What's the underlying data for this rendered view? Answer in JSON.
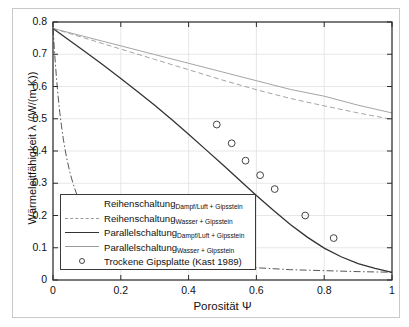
{
  "chart_data": {
    "type": "line",
    "title": "",
    "xlabel": "Porosität Ψ",
    "ylabel": "Wärmeleitfähigkeit λ /(W/(m K))",
    "xlim": [
      0,
      1
    ],
    "ylim": [
      0,
      0.8
    ],
    "xticks": [
      "0",
      "0.2",
      "0.4",
      "0.6",
      "0.8",
      "1"
    ],
    "xtick_values": [
      0,
      0.2,
      0.4,
      0.6,
      0.8,
      1
    ],
    "yticks": [
      "0",
      "0.1",
      "0.2",
      "0.3",
      "0.4",
      "0.5",
      "0.6",
      "0.7",
      "0.8"
    ],
    "ytick_values": [
      0,
      0.1,
      0.2,
      0.3,
      0.4,
      0.5,
      0.6,
      0.7,
      0.8
    ],
    "grid": true,
    "legend_position": "lower-left",
    "series": [
      {
        "name": "Reihenschaltung",
        "subscript": "Dampf/Luft + Gipsstein",
        "style": "dash-dot",
        "color": "#444444",
        "points": [
          [
            0.0,
            0.78
          ],
          [
            0.005,
            0.7
          ],
          [
            0.01,
            0.63
          ],
          [
            0.015,
            0.57
          ],
          [
            0.02,
            0.52
          ],
          [
            0.025,
            0.478
          ],
          [
            0.03,
            0.44
          ],
          [
            0.035,
            0.408
          ],
          [
            0.04,
            0.38
          ],
          [
            0.05,
            0.333
          ],
          [
            0.06,
            0.296
          ],
          [
            0.07,
            0.266
          ],
          [
            0.08,
            0.241
          ],
          [
            0.1,
            0.201
          ],
          [
            0.12,
            0.172
          ],
          [
            0.15,
            0.141
          ],
          [
            0.2,
            0.108
          ],
          [
            0.3,
            0.074
          ],
          [
            0.4,
            0.056
          ],
          [
            0.5,
            0.045
          ],
          [
            0.6,
            0.038
          ],
          [
            0.7,
            0.032
          ],
          [
            0.8,
            0.029
          ],
          [
            0.9,
            0.026
          ],
          [
            1.0,
            0.024
          ]
        ]
      },
      {
        "name": "Reihenschaltung",
        "subscript": "Wasser + Gipsstein",
        "style": "dashed",
        "color": "#9a9a9a",
        "points": [
          [
            0.0,
            0.78
          ],
          [
            0.1,
            0.748
          ],
          [
            0.2,
            0.716
          ],
          [
            0.3,
            0.684
          ],
          [
            0.4,
            0.652
          ],
          [
            0.5,
            0.62
          ],
          [
            0.6,
            0.59
          ],
          [
            0.7,
            0.563
          ],
          [
            0.8,
            0.54
          ],
          [
            0.9,
            0.518
          ],
          [
            1.0,
            0.498
          ]
        ]
      },
      {
        "name": "Parallelschaltung",
        "subscript": "Dampf/Luft + Gipsstein",
        "style": "solid",
        "color": "#333333",
        "points": [
          [
            0.0,
            0.78
          ],
          [
            0.05,
            0.742
          ],
          [
            0.1,
            0.704
          ],
          [
            0.15,
            0.665
          ],
          [
            0.2,
            0.625
          ],
          [
            0.25,
            0.584
          ],
          [
            0.3,
            0.542
          ],
          [
            0.35,
            0.498
          ],
          [
            0.4,
            0.452
          ],
          [
            0.45,
            0.405
          ],
          [
            0.5,
            0.358
          ],
          [
            0.55,
            0.31
          ],
          [
            0.6,
            0.262
          ],
          [
            0.65,
            0.216
          ],
          [
            0.7,
            0.172
          ],
          [
            0.75,
            0.133
          ],
          [
            0.8,
            0.099
          ],
          [
            0.85,
            0.072
          ],
          [
            0.9,
            0.051
          ],
          [
            0.95,
            0.036
          ],
          [
            1.0,
            0.024
          ]
        ]
      },
      {
        "name": "Parallelschaltung",
        "subscript": "Wasser + Gipsstein",
        "style": "solid-light",
        "color": "#9a9a9a",
        "points": [
          [
            0.0,
            0.78
          ],
          [
            0.1,
            0.753
          ],
          [
            0.2,
            0.726
          ],
          [
            0.3,
            0.699
          ],
          [
            0.4,
            0.672
          ],
          [
            0.5,
            0.645
          ],
          [
            0.6,
            0.618
          ],
          [
            0.7,
            0.591
          ],
          [
            0.8,
            0.57
          ],
          [
            0.9,
            0.542
          ],
          [
            1.0,
            0.518
          ]
        ]
      },
      {
        "name": "Trockene Gipsplatte (Kast 1989)",
        "style": "scatter",
        "marker": "circle",
        "color": "#444444",
        "points": [
          [
            0.483,
            0.482
          ],
          [
            0.527,
            0.424
          ],
          [
            0.568,
            0.37
          ],
          [
            0.611,
            0.325
          ],
          [
            0.654,
            0.282
          ],
          [
            0.744,
            0.2
          ],
          [
            0.828,
            0.13
          ]
        ]
      }
    ]
  },
  "axis": {
    "ylabel": "Wärmeleitfähigkeit λ /(W/(m K))",
    "xlabel": "Porosität Ψ"
  },
  "legend": {
    "items": [
      {
        "label": "Reihenschaltung",
        "subscript": "Dampf/Luft + Gipsstein",
        "style": "dash-dot"
      },
      {
        "label": "Reihenschaltung",
        "subscript": "Wasser + Gipsstein",
        "style": "dashed"
      },
      {
        "label": "Parallelschaltung",
        "subscript": "Dampf/Luft + Gipsstein",
        "style": "solid-dark"
      },
      {
        "label": "Parallelschaltung",
        "subscript": "Wasser + Gipsstein",
        "style": "solid-light"
      },
      {
        "label": "Trockene Gipsplatte (Kast 1989)",
        "subscript": "",
        "style": "marker"
      }
    ]
  },
  "colors": {
    "dark": "#333333",
    "light": "#9a9a9a",
    "axis": "#2b2b2b",
    "grid": "#d8d8d8",
    "background": "#ffffff"
  }
}
